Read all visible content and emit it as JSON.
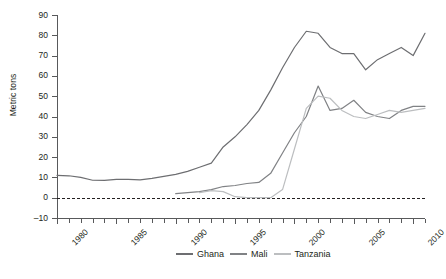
{
  "chart_data": {
    "type": "line",
    "title": "",
    "xlabel": "",
    "ylabel": "Metric tons",
    "xlim": [
      1980,
      2011
    ],
    "ylim": [
      -10,
      90
    ],
    "yticks": [
      90,
      80,
      70,
      60,
      50,
      40,
      30,
      20,
      10,
      0,
      -10
    ],
    "ytick_labels": [
      "90",
      "80",
      "70",
      "60",
      "50",
      "40",
      "30",
      "20",
      "10",
      "0",
      "−0"
    ],
    "xtick_labels": [
      "1980",
      "1985",
      "1990",
      "1995",
      "2000",
      "2005",
      "2010"
    ],
    "xticks_major": [
      1980,
      1985,
      1990,
      1995,
      2000,
      2005,
      2010
    ],
    "xticks_minor_step": 1,
    "grid": false,
    "zero_reference_line": true,
    "legend_position": "bottom",
    "x": [
      1980,
      1981,
      1982,
      1983,
      1984,
      1985,
      1986,
      1987,
      1988,
      1989,
      1990,
      1991,
      1992,
      1993,
      1994,
      1995,
      1996,
      1997,
      1998,
      1999,
      2000,
      2001,
      2002,
      2003,
      2004,
      2005,
      2006,
      2007,
      2008,
      2009,
      2010,
      2011
    ],
    "series": [
      {
        "name": "Ghana",
        "color": "#6d6e71",
        "values": [
          11,
          10.8,
          10,
          8.6,
          8.5,
          9,
          9,
          8.8,
          9.5,
          10.5,
          11.5,
          13,
          15,
          17,
          25,
          30,
          36,
          43,
          53,
          64,
          74,
          82,
          81,
          74,
          71,
          71,
          63,
          68,
          71,
          74,
          70,
          81
        ]
      },
      {
        "name": "Mali",
        "color": "#808285",
        "values": [
          null,
          null,
          null,
          null,
          null,
          null,
          null,
          null,
          null,
          null,
          2,
          2.5,
          3,
          4,
          5.5,
          6,
          7,
          7.5,
          12,
          22,
          32,
          40,
          55,
          43,
          44,
          48,
          42,
          40,
          39,
          43,
          45,
          45
        ]
      },
      {
        "name": "Tanzania",
        "color": "#bcbec0",
        "values": [
          null,
          null,
          null,
          null,
          null,
          null,
          null,
          null,
          null,
          null,
          null,
          null,
          2.5,
          3.5,
          3,
          0.5,
          0,
          0,
          0,
          4,
          24,
          44,
          50,
          49,
          43,
          40,
          39,
          41,
          43,
          42,
          43,
          44
        ]
      }
    ]
  },
  "legend": {
    "entries": [
      {
        "label": "Ghana"
      },
      {
        "label": "Mali"
      },
      {
        "label": "Tanzania"
      }
    ]
  }
}
